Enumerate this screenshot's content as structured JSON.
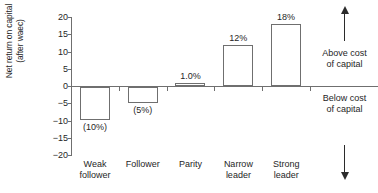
{
  "chart_data": {
    "type": "bar",
    "title": "",
    "xlabel": "",
    "ylabel_line1": "Net return on capital",
    "ylabel_line2": "(after waec)",
    "ylim": [
      -20,
      20
    ],
    "yticks": [
      20,
      15,
      10,
      5,
      0,
      "−5",
      "−10",
      "−15",
      "−20"
    ],
    "grid": false,
    "legend": "none",
    "categories": [
      {
        "line1": "Weak",
        "line2": "follower"
      },
      {
        "line1": "Follower",
        "line2": ""
      },
      {
        "line1": "Parity",
        "line2": ""
      },
      {
        "line1": "Narrow",
        "line2": "leader"
      },
      {
        "line1": "Strong",
        "line2": "leader"
      }
    ],
    "values": [
      -9.5,
      -4.7,
      1.0,
      12.0,
      18.0
    ],
    "data_labels": [
      "(10%)",
      "(5%)",
      "1.0%",
      "12%",
      "18%"
    ],
    "bar_fill": "#ffffff",
    "bar_stroke": "#6f6f6f",
    "axis_color": "#6f6f6f"
  },
  "annotations": {
    "above": {
      "line1": "Above cost",
      "line2": "of capital"
    },
    "below": {
      "line1": "Below cost",
      "line2": "of capital"
    },
    "arrow_up": "up-arrow-icon",
    "arrow_down": "down-arrow-icon"
  }
}
